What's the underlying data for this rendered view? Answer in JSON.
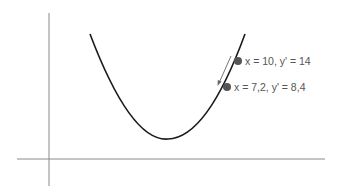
{
  "figure": {
    "colors": {
      "axis": "#8a8a8a",
      "curve": "#1a1a1a",
      "point": "#555555",
      "arrow": "#666666",
      "label": "#555555"
    },
    "points": [
      {
        "label": "x = 10, y' = 14",
        "x": 10,
        "dy": 14
      },
      {
        "label": "x = 7,2, y' = 8,4",
        "x": 7.2,
        "dy": 8.4
      }
    ],
    "arrow": {
      "direction": "down-left",
      "meaning": "gradient descent step"
    }
  }
}
